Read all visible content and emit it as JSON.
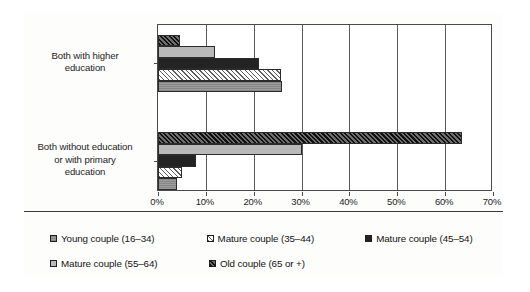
{
  "chart_data": {
    "type": "bar",
    "orientation": "horizontal",
    "title": "",
    "subtitle": "",
    "xlabel": "",
    "ylabel": "",
    "xlim": [
      0,
      70
    ],
    "grid": true,
    "legend_position": "bottom",
    "categories": [
      "Both with higher education",
      "Both without education or with primary education"
    ],
    "category_lines": [
      [
        "Both with higher",
        "education"
      ],
      [
        "Both without education",
        "or with primary",
        "education"
      ]
    ],
    "xticks": [
      0,
      10,
      20,
      30,
      40,
      50,
      60,
      70
    ],
    "xtick_labels": [
      "0%",
      "10%",
      "20%",
      "30%",
      "40%",
      "50%",
      "60%",
      "70%"
    ],
    "series": [
      {
        "name": "Young couple (16–34)",
        "pattern": "solid-medium-gray",
        "color": "#8f8f8f",
        "values": [
          26.0,
          4.0
        ]
      },
      {
        "name": "Mature couple (35–44)",
        "pattern": "light-diagonal-hatch",
        "color": "#ffffff",
        "values": [
          25.8,
          5.0
        ]
      },
      {
        "name": "Mature couple (45–54)",
        "pattern": "solid-black",
        "color": "#232323",
        "values": [
          21.0,
          8.0
        ]
      },
      {
        "name": "Mature couple (55–64)",
        "pattern": "solid-light-gray",
        "color": "#b9b9b9",
        "values": [
          12.0,
          30.0
        ]
      },
      {
        "name": "Old couple (65 or +)",
        "pattern": "dark-diagonal-hatch",
        "color": "#3a3a3a",
        "values": [
          4.5,
          63.5
        ]
      }
    ]
  },
  "legend": {
    "rows": [
      [
        {
          "label": "Young couple (16–34)",
          "swatch": "solid-medium-gray"
        },
        {
          "label": "Mature couple (35–44)",
          "swatch": "light-diagonal-hatch"
        },
        {
          "label": "Mature couple (45–54)",
          "swatch": "solid-black"
        }
      ],
      [
        {
          "label": "Mature couple (55–64)",
          "swatch": "solid-light-gray"
        },
        {
          "label": "Old couple (65 or +)",
          "swatch": "dark-diagonal-hatch"
        }
      ]
    ]
  }
}
